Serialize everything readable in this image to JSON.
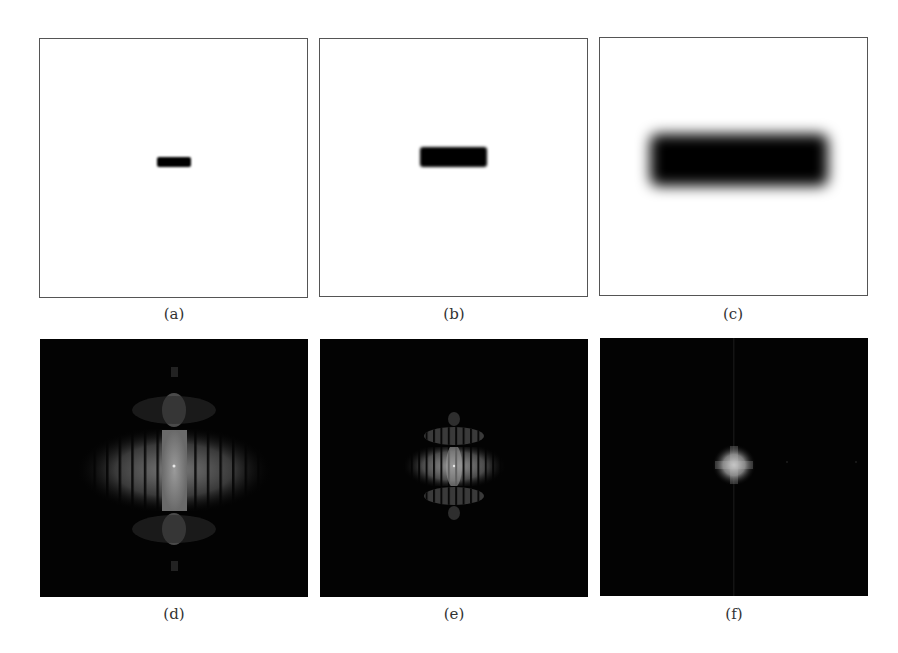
{
  "figure": {
    "panels": [
      {
        "id": "a",
        "label": "(a)",
        "type": "spatial",
        "description": "small rectangle"
      },
      {
        "id": "b",
        "label": "(b)",
        "type": "spatial",
        "description": "medium rectangle (slightly blurred)"
      },
      {
        "id": "c",
        "label": "(c)",
        "type": "spatial",
        "description": "large blurred rectangle"
      },
      {
        "id": "d",
        "label": "(d)",
        "type": "frequency",
        "description": "Fourier spectrum of (a)"
      },
      {
        "id": "e",
        "label": "(e)",
        "type": "frequency",
        "description": "Fourier spectrum of (b)"
      },
      {
        "id": "f",
        "label": "(f)",
        "type": "frequency",
        "description": "Fourier spectrum of (c)"
      }
    ],
    "colors": {
      "spatial_bg": "#ffffff",
      "shape": "#000000",
      "frequency_bg": "#030303",
      "frequency_glow": "#bdbdbd",
      "border": "#555555"
    }
  }
}
